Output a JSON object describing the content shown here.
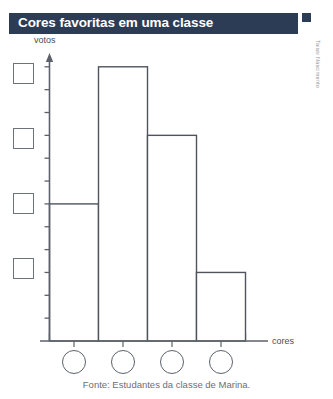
{
  "title": {
    "text": "Cores favoritas em uma classe"
  },
  "credit": {
    "text": "Taiasi Nascimento"
  },
  "footer": {
    "source": "Fonte: Estudantes da classe de Marina."
  },
  "colors": {
    "title_bar": "#2c3c55",
    "title_text": "#ffffff",
    "axis": "#5d626a",
    "bar_outline": "#4f545c",
    "bar_fill": "#ffffff",
    "answer_box_outline": "#6e737b",
    "label_text": "#4a4f57",
    "footer_text": "#6a6f77"
  },
  "answer_squares": [
    {
      "label": "",
      "name": "answer-square-1"
    },
    {
      "label": "",
      "name": "answer-square-2"
    },
    {
      "label": "",
      "name": "answer-square-3"
    },
    {
      "label": "",
      "name": "answer-square-4"
    }
  ],
  "answer_circles": [
    {
      "label": "",
      "name": "answer-circle-1"
    },
    {
      "label": "",
      "name": "answer-circle-2"
    },
    {
      "label": "",
      "name": "answer-circle-3"
    },
    {
      "label": "",
      "name": "answer-circle-4"
    }
  ],
  "chart_data": {
    "type": "bar",
    "title": "Cores favoritas em uma classe",
    "subtitle": "",
    "xlabel": "cores",
    "ylabel": "votos",
    "categories": [
      "",
      "",
      "",
      ""
    ],
    "values": [
      6,
      12,
      9,
      3
    ],
    "ylim": [
      0,
      13
    ],
    "ytick_interval": 1,
    "ytick_labels": [],
    "xtick_labels": [],
    "grid": false,
    "legend": null,
    "annotations": [
      "Eixo vertical rotulado 'votos' com marcas de escala sem numeros.",
      "Eixo horizontal rotulado 'cores' com quatro categorias em branco.",
      "Quatro quadrados em branco a esquerda do eixo vertical para preencher valores.",
      "Quatro circulos em branco abaixo do eixo horizontal para preencher as cores."
    ],
    "source": "Fonte: Estudantes da classe de Marina."
  }
}
